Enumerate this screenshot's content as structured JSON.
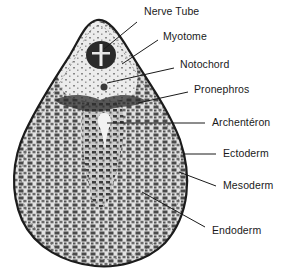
{
  "figure": {
    "labels": [
      {
        "id": "nerve-tube",
        "text": "Nerve Tube",
        "x": 144,
        "y": 11
      },
      {
        "id": "myotome",
        "text": "Myotome",
        "x": 163,
        "y": 35
      },
      {
        "id": "notochord",
        "text": "Notochord",
        "x": 179,
        "y": 62
      },
      {
        "id": "pronephros",
        "text": "Pronephros",
        "x": 193,
        "y": 86
      },
      {
        "id": "archenteron",
        "text": "Archentéron",
        "x": 212,
        "y": 117
      },
      {
        "id": "ectoderm",
        "text": "Ectoderm",
        "x": 223,
        "y": 148
      },
      {
        "id": "mesoderm",
        "text": "Mesoderm",
        "x": 223,
        "y": 179
      },
      {
        "id": "endoderm",
        "text": "Endoderm",
        "x": 212,
        "y": 224
      }
    ],
    "colors": {
      "outline": "#1c1c1c",
      "tissue_light": "#d9d9d9",
      "tissue_dark": "#3a3a3a",
      "background": "#ffffff"
    }
  }
}
